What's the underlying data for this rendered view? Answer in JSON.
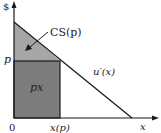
{
  "diagram": {
    "y_axis_label": "$",
    "x_axis_label": "x",
    "origin_label": "0",
    "price_label": "p",
    "quantity_label": "x(p)",
    "curve_label": "u′(x)",
    "surplus_label": "CS(p)",
    "expenditure_label": "px",
    "colors": {
      "surplus_fill": "#a6a6a6",
      "expenditure_fill": "#7c7c7c",
      "lines": "#1a1a1a",
      "background": "#ffffff"
    },
    "geometry": {
      "origin": [
        14,
        118
      ],
      "y_axis_top": 2,
      "x_axis_right": 158,
      "curve_start": [
        14,
        22
      ],
      "curve_end": [
        132,
        118
      ],
      "price_y": 61,
      "quantity_x": 60
    }
  }
}
